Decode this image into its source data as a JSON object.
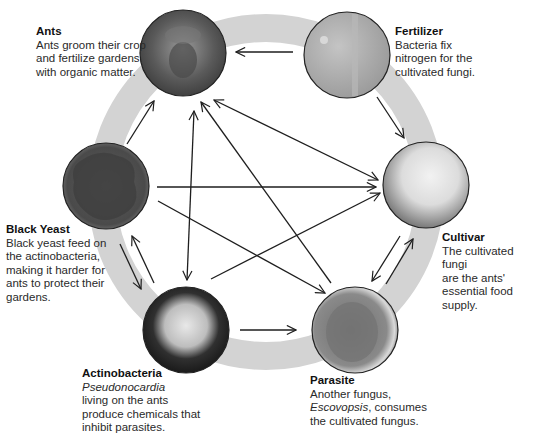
{
  "colors": {
    "ring": "#d3d3d3",
    "arrow": "#1e1e1e",
    "circle_border": "#222222",
    "background": "#ffffff"
  },
  "nodes": [
    {
      "id": "ants",
      "title": "Ants",
      "lines": [
        "Ants groom their crop",
        "and fertilize gardens",
        "with organic matter."
      ],
      "italic_line": null,
      "cx": 183,
      "cy": 53,
      "fill": "#6f6f6f"
    },
    {
      "id": "fertilizer",
      "title": "Fertilizer",
      "lines": [
        "Bacteria fix",
        "nitrogen for the",
        "cultivated fungi."
      ],
      "italic_line": null,
      "cx": 347,
      "cy": 55,
      "fill": "#a9a9a9"
    },
    {
      "id": "cultivar",
      "title": "Cultivar",
      "lines": [
        "The cultivated fungi",
        "are the ants'",
        "essential food supply."
      ],
      "italic_line": null,
      "cx": 426,
      "cy": 185,
      "fill": "#cfcfcf"
    },
    {
      "id": "parasite",
      "title": "Parasite",
      "lines": [
        "Another fungus,",
        "Escovopsis, consumes",
        "the cultivated fungus."
      ],
      "italic_word": "Escovopsis",
      "cx": 355,
      "cy": 330,
      "fill": "#8a8a8a"
    },
    {
      "id": "actinobacteria",
      "title": "Actinobacteria",
      "lines": [
        "Pseudonocardia",
        "living on the ants",
        "produce chemicals that",
        "inhibit parasites."
      ],
      "italic_word": "Pseudonocardia",
      "cx": 186,
      "cy": 330,
      "fill": "#2a2a2a"
    },
    {
      "id": "black_yeast",
      "title": "Black Yeast",
      "lines": [
        "Black yeast feed on",
        "the actinobacteria,",
        "making it harder for",
        "ants to protect their",
        "gardens."
      ],
      "italic_line": null,
      "cx": 106,
      "cy": 186,
      "fill": "#5a5a5a"
    }
  ],
  "labels": {
    "ants": {
      "title": "Ants",
      "l1": "Ants groom their crop",
      "l2": "and fertilize gardens",
      "l3": "with organic matter."
    },
    "fertilizer": {
      "title": "Fertilizer",
      "l1": "Bacteria fix",
      "l2": "nitrogen for the",
      "l3": "cultivated fungi."
    },
    "cultivar": {
      "title": "Cultivar",
      "l1": "The cultivated fungi",
      "l2": "are the ants'",
      "l3": "essential food supply."
    },
    "parasite": {
      "title": "Parasite",
      "l1": "Another fungus,",
      "l2_italic": "Escovopsis",
      "l2_rest": ", consumes",
      "l3": "the cultivated fungus."
    },
    "actinobacteria": {
      "title": "Actinobacteria",
      "l1_italic": "Pseudonocardia",
      "l2": "living on the ants",
      "l3": "produce chemicals that",
      "l4": "inhibit parasites."
    },
    "black_yeast": {
      "title": "Black Yeast",
      "l1": "Black yeast feed on",
      "l2": "the actinobacteria,",
      "l3": "making it harder for",
      "l4": "ants to protect their",
      "l5": "gardens."
    }
  },
  "edges": [
    {
      "from": "fertilizer",
      "to": "ants",
      "type": "ring"
    },
    {
      "from": "fertilizer",
      "to": "cultivar",
      "type": "ring"
    },
    {
      "from": "cultivar",
      "to": "parasite",
      "type": "ring"
    },
    {
      "from": "parasite",
      "to": "cultivar",
      "type": "ring"
    },
    {
      "from": "actinobacteria",
      "to": "parasite",
      "type": "ring"
    },
    {
      "from": "black_yeast",
      "to": "actinobacteria",
      "type": "ring"
    },
    {
      "from": "actinobacteria",
      "to": "black_yeast",
      "type": "ring"
    },
    {
      "from": "black_yeast",
      "to": "ants",
      "type": "ring"
    },
    {
      "from": "ants",
      "to": "cultivar",
      "type": "bidirectional"
    },
    {
      "from": "ants",
      "to": "actinobacteria",
      "type": "bidirectional"
    },
    {
      "from": "parasite",
      "to": "ants",
      "type": "inner"
    },
    {
      "from": "black_yeast",
      "to": "cultivar",
      "type": "inner"
    },
    {
      "from": "black_yeast",
      "to": "parasite",
      "type": "inner"
    },
    {
      "from": "actinobacteria",
      "to": "cultivar",
      "type": "inner"
    }
  ]
}
